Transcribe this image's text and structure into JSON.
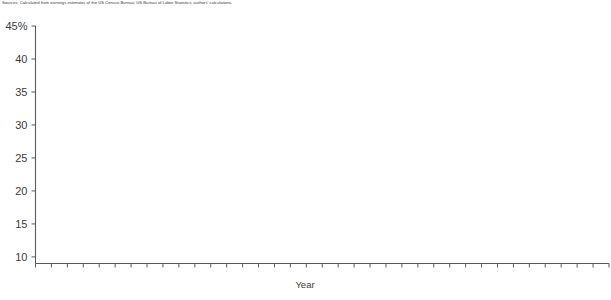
{
  "caption": {
    "text": "Sources: Calculated from earnings estimates of the US Census Bureau; US Bureau of Labor Statistics; authors' calculations."
  },
  "axis": {
    "x_title": "Year",
    "y_top_label": "45%",
    "y_tick_labels": [
      "45%",
      "40",
      "35",
      "30",
      "25",
      "20",
      "15",
      "10"
    ],
    "x_tick_labels": [
      "1977",
      "1980",
      "1985",
      "1990",
      "1995",
      "2000",
      "2005",
      "2010"
    ]
  },
  "style": {
    "line_color": "#8c8c8c",
    "axis_color": "#5a5a5a",
    "text_color": "#3c3c3c",
    "background": "#ffffff",
    "line_width": 3.2
  },
  "chart_data": {
    "type": "line",
    "title": "",
    "subtitle": "",
    "xlabel": "Year",
    "ylabel": "",
    "xlim": [
      1977,
      2013
    ],
    "ylim": [
      9,
      45
    ],
    "grid": false,
    "legend": "none",
    "y_unit": "percent",
    "y_ticks": [
      10,
      15,
      20,
      25,
      30,
      35,
      40,
      45
    ],
    "y_tick_labels": [
      "10",
      "15",
      "20",
      "25",
      "30",
      "35",
      "40",
      "45%"
    ],
    "x_ticks": [
      1977,
      1980,
      1985,
      1990,
      1995,
      2000,
      2005,
      2010
    ],
    "x_minor_tick_every": 1,
    "x": [
      1977,
      1978,
      1979,
      1980,
      1981,
      1982,
      1983,
      1984,
      1985,
      1986,
      1987,
      1988,
      1989,
      1990,
      1991,
      1992,
      1993,
      1994,
      1995,
      1996,
      1997,
      1998,
      1999,
      2000,
      2001,
      2002,
      2003,
      2004,
      2005,
      2006,
      2007,
      2008,
      2009,
      2010,
      2011,
      2012,
      2013
    ],
    "series": [
      {
        "name": "Share",
        "values": [
          41.5,
          43.8,
          37.0,
          33.0,
          28.5,
          26.2,
          28.0,
          24.5,
          23.5,
          22.0,
          20.0,
          14.7,
          15.0,
          14.9,
          14.5,
          15.3,
          16.0,
          15.6,
          15.7,
          15.6,
          16.0,
          15.8,
          15.6,
          16.0,
          15.3,
          17.8,
          19.0,
          19.0,
          18.6,
          13.5,
          10.4,
          10.8,
          17.0,
          17.6,
          16.5,
          18.0,
          14.3
        ]
      }
    ]
  }
}
